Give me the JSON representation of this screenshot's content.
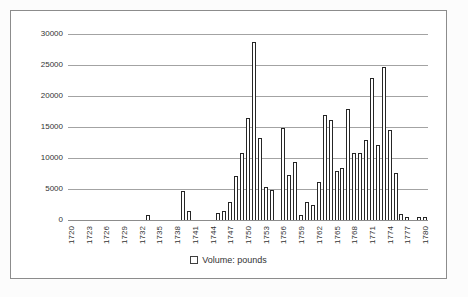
{
  "chart": {
    "legend": {
      "marker": "white-square-outline",
      "label": "Volume: pounds"
    },
    "colors": {
      "bar_fill": "#ffffff",
      "bar_border": "#262626",
      "gridline": "#a3a3a3",
      "axis": "#8c8c8c",
      "frame_border": "#8c8c8c",
      "text": "#333333",
      "background": "#ffffff"
    }
  },
  "chart_data": {
    "type": "bar",
    "title": "",
    "xlabel": "",
    "ylabel": "",
    "series_name": "Volume: pounds",
    "x": [
      1720,
      1721,
      1722,
      1723,
      1724,
      1725,
      1726,
      1727,
      1728,
      1729,
      1730,
      1731,
      1732,
      1733,
      1734,
      1735,
      1736,
      1737,
      1738,
      1739,
      1740,
      1741,
      1742,
      1743,
      1744,
      1745,
      1746,
      1747,
      1748,
      1749,
      1750,
      1751,
      1752,
      1753,
      1754,
      1755,
      1756,
      1757,
      1758,
      1759,
      1760,
      1761,
      1762,
      1763,
      1764,
      1765,
      1766,
      1767,
      1768,
      1769,
      1770,
      1771,
      1772,
      1773,
      1774,
      1775,
      1776,
      1777,
      1778,
      1779,
      1780
    ],
    "values": [
      0,
      0,
      0,
      0,
      0,
      0,
      0,
      0,
      0,
      0,
      0,
      0,
      0,
      600,
      0,
      0,
      0,
      0,
      0,
      4500,
      1300,
      0,
      0,
      0,
      0,
      1000,
      1300,
      2700,
      7000,
      10600,
      16300,
      28500,
      13000,
      5100,
      4700,
      0,
      14700,
      7100,
      9200,
      700,
      2800,
      2300,
      6000,
      16800,
      16000,
      7800,
      8300,
      17700,
      10600,
      10600,
      12700,
      22700,
      11900,
      24500,
      14300,
      7400,
      800,
      300,
      0,
      350,
      300
    ],
    "x_tick_labels": [
      "1720",
      "1723",
      "1726",
      "1729",
      "1732",
      "1735",
      "1738",
      "1741",
      "1744",
      "1747",
      "1750",
      "1753",
      "1756",
      "1759",
      "1762",
      "1765",
      "1768",
      "1771",
      "1774",
      "1777",
      "1780"
    ],
    "x_tick_step": 3,
    "y_ticks": [
      0,
      5000,
      10000,
      15000,
      20000,
      25000,
      30000
    ],
    "ylim": [
      0,
      30000
    ],
    "grid": true,
    "legend": [
      "Volume: pounds"
    ],
    "legend_position": "bottom",
    "bar_style": "white fill with dark outline"
  }
}
